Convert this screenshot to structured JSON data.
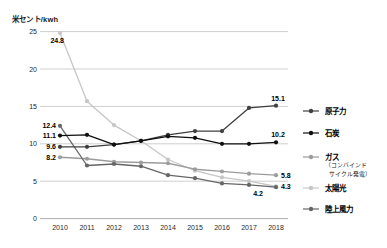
{
  "chart_data": {
    "type": "line",
    "title": "",
    "ylabel": "米セント/kwh",
    "xlabel": "",
    "x": [
      2010,
      2011,
      2012,
      2013,
      2014,
      2015,
      2016,
      2017,
      2018
    ],
    "ylim": [
      0,
      25
    ],
    "yticks": [
      0,
      5,
      10,
      15,
      20,
      25
    ],
    "grid": "horizontal",
    "legend_position": "right",
    "series": [
      {
        "key": "solar",
        "name": "太陽光",
        "color": "#c6c6c6",
        "values": [
          24.8,
          15.7,
          12.5,
          10.4,
          7.9,
          6.4,
          5.5,
          5.0,
          4.3
        ],
        "start_label": {
          "text": "24.8",
          "dx": 4,
          "dy": 10,
          "anchor": "end"
        },
        "end_label": {
          "text": "4.3",
          "dx": 5,
          "dy": 2.5,
          "anchor": "start"
        }
      },
      {
        "key": "gas",
        "name": "ガス",
        "sub_name": "（コンバインドサイクル発電）",
        "color": "#9c9c9c",
        "values": [
          8.2,
          8.0,
          7.6,
          7.5,
          7.4,
          6.6,
          6.3,
          6.0,
          5.8
        ],
        "start_label": {
          "text": "8.2",
          "dx": -4,
          "dy": 2.5,
          "anchor": "end"
        },
        "end_label": {
          "text": "5.8",
          "dx": 5,
          "dy": 2.5,
          "anchor": "start"
        }
      },
      {
        "key": "wind",
        "name": "陸上風力",
        "color": "#666666",
        "values": [
          12.4,
          7.1,
          7.3,
          7.0,
          5.8,
          5.4,
          4.7,
          4.5,
          4.2
        ],
        "start_label": {
          "text": "12.4",
          "dx": -4,
          "dy": 2.5,
          "anchor": "end"
        },
        "end_label": {
          "text": "4.2",
          "dx": -18,
          "dy": 9,
          "anchor": "middle"
        }
      },
      {
        "key": "nuclear",
        "name": "原子力",
        "color": "#404040",
        "values": [
          9.6,
          9.6,
          9.9,
          10.4,
          11.2,
          11.7,
          11.7,
          14.8,
          15.1
        ],
        "start_label": {
          "text": "9.6",
          "dx": -4,
          "dy": 2.5,
          "anchor": "end"
        },
        "end_label": {
          "text": "15.1",
          "dx": 2,
          "dy": -5,
          "anchor": "middle"
        }
      },
      {
        "key": "coal",
        "name": "石炭",
        "color": "#0f0f0f",
        "values": [
          11.1,
          11.2,
          9.9,
          10.4,
          11.0,
          10.8,
          10.0,
          10.0,
          10.2
        ],
        "start_label": {
          "text": "11.1",
          "dx": -4,
          "dy": 2.5,
          "anchor": "end"
        },
        "end_label": {
          "text": "10.2",
          "dx": 2,
          "dy": -5,
          "anchor": "middle"
        }
      }
    ],
    "legend": [
      {
        "key": "nuclear",
        "label": "原子力",
        "color": "#404040",
        "sub": []
      },
      {
        "key": "coal",
        "label": "石炭",
        "color": "#0f0f0f",
        "sub": []
      },
      {
        "key": "gas",
        "label": "ガス",
        "color": "#9c9c9c",
        "sub": [
          "（コンバインド",
          "サイクル発電）"
        ]
      },
      {
        "key": "solar",
        "label": "太陽光",
        "color": "#c6c6c6",
        "sub": []
      },
      {
        "key": "wind",
        "label": "陸上風力",
        "color": "#666666",
        "sub": []
      }
    ],
    "colors": {
      "grid": "#cfcfcf",
      "axis": "#adadad",
      "tick_text": "#1f1f1f",
      "label_text": "#000000"
    }
  }
}
